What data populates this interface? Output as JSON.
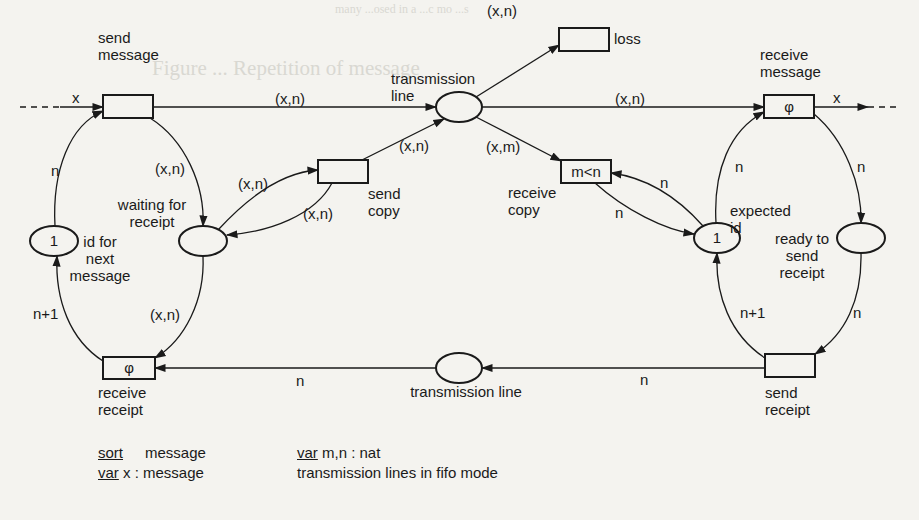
{
  "figure": {
    "ink_color": "#1a1a1a",
    "paper_color": "#f4f3ef",
    "bleed_through": [
      {
        "text": "many ...osed in a ...c mo ...s",
        "x": 335,
        "y": 4,
        "size": 12
      },
      {
        "text": "Figure ... Repetition of message",
        "x": 152,
        "y": 67,
        "size": 21
      }
    ],
    "transitions": [
      {
        "id": "send-message",
        "x": 103,
        "y": 95,
        "w": 50,
        "h": 23,
        "inscription": "",
        "label": [
          "send",
          "message"
        ],
        "label_x": 98,
        "label_y": 43,
        "label_anchor": "start"
      },
      {
        "id": "loss",
        "x": 559,
        "y": 28,
        "w": 50,
        "h": 23,
        "inscription": "",
        "label": [
          "loss"
        ],
        "label_x": 614,
        "label_y": 44,
        "label_anchor": "start"
      },
      {
        "id": "receive-message",
        "x": 764,
        "y": 95,
        "w": 50,
        "h": 23,
        "inscription": "φ",
        "label": [
          "receive",
          "message"
        ],
        "label_x": 760,
        "label_y": 60,
        "label_anchor": "start"
      },
      {
        "id": "send-copy",
        "x": 318,
        "y": 160,
        "w": 50,
        "h": 23,
        "inscription": "",
        "label": [
          "send",
          "copy"
        ],
        "label_x": 368,
        "label_y": 199,
        "label_anchor": "start"
      },
      {
        "id": "receive-copy",
        "x": 561,
        "y": 160,
        "w": 50,
        "h": 23,
        "inscription": "m<n",
        "label": [
          "receive",
          "copy"
        ],
        "label_x": 508,
        "label_y": 198,
        "label_anchor": "start"
      },
      {
        "id": "receive-receipt",
        "x": 103,
        "y": 357,
        "w": 52,
        "h": 22,
        "inscription": "φ",
        "label": [
          "receive",
          "receipt"
        ],
        "label_x": 98,
        "label_y": 398,
        "label_anchor": "start"
      },
      {
        "id": "send-receipt",
        "x": 765,
        "y": 354,
        "w": 50,
        "h": 23,
        "inscription": "",
        "label": [
          "send",
          "receipt"
        ],
        "label_x": 765,
        "label_y": 398,
        "label_anchor": "start"
      }
    ],
    "places": [
      {
        "id": "id-for-next-message",
        "cx": 54,
        "cy": 241,
        "rx": 24,
        "ry": 15,
        "token": "1",
        "label": [
          "id for",
          "next",
          "message"
        ],
        "label_x": 100,
        "label_y": 247,
        "label_anchor": "middle"
      },
      {
        "id": "waiting-for-receipt",
        "cx": 203,
        "cy": 241,
        "rx": 24,
        "ry": 15,
        "token": "",
        "label": [
          "waiting for",
          "receipt"
        ],
        "label_x": 152,
        "label_y": 210,
        "label_anchor": "middle"
      },
      {
        "id": "transmission-line-top",
        "cx": 459,
        "cy": 107,
        "rx": 23,
        "ry": 15,
        "token": "",
        "label": [
          "transmission",
          "line"
        ],
        "label_x": 391,
        "label_y": 84,
        "label_anchor": "start"
      },
      {
        "id": "expected-id",
        "cx": 717,
        "cy": 238,
        "rx": 23,
        "ry": 15,
        "token": "1",
        "label": [
          "expected",
          "id"
        ],
        "label_x": 730,
        "label_y": 216,
        "label_anchor": "start"
      },
      {
        "id": "ready-to-send-receipt",
        "cx": 861,
        "cy": 238,
        "rx": 24,
        "ry": 15,
        "token": "",
        "label": [
          "ready to",
          "send",
          "receipt"
        ],
        "label_x": 802,
        "label_y": 244,
        "label_anchor": "middle"
      },
      {
        "id": "transmission-line-bottom",
        "cx": 459,
        "cy": 368,
        "rx": 23,
        "ry": 15,
        "token": "",
        "label": [
          "transmission line"
        ],
        "label_x": 466,
        "label_y": 397,
        "label_anchor": "middle"
      }
    ],
    "arc_labels": [
      {
        "text": "x",
        "x": 72,
        "y": 103
      },
      {
        "text": "(x,n)",
        "x": 275,
        "y": 104
      },
      {
        "text": "(x,n)",
        "x": 487,
        "y": 16
      },
      {
        "text": "(x,n)",
        "x": 615,
        "y": 104
      },
      {
        "text": "x",
        "x": 833,
        "y": 103
      },
      {
        "text": "n",
        "x": 51,
        "y": 176
      },
      {
        "text": "(x,n)",
        "x": 155,
        "y": 174
      },
      {
        "text": "(x,n)",
        "x": 238,
        "y": 189
      },
      {
        "text": "(x,n)",
        "x": 303,
        "y": 219
      },
      {
        "text": "(x,n)",
        "x": 399,
        "y": 151
      },
      {
        "text": "(x,m)",
        "x": 486,
        "y": 152
      },
      {
        "text": "n",
        "x": 660,
        "y": 188
      },
      {
        "text": "n",
        "x": 615,
        "y": 218
      },
      {
        "text": "n",
        "x": 735,
        "y": 172
      },
      {
        "text": "n",
        "x": 857,
        "y": 172
      },
      {
        "text": "n+1",
        "x": 33,
        "y": 319
      },
      {
        "text": "(x,n)",
        "x": 150,
        "y": 320
      },
      {
        "text": "n",
        "x": 296,
        "y": 386
      },
      {
        "text": "n+1",
        "x": 740,
        "y": 318
      },
      {
        "text": "n",
        "x": 853,
        "y": 318
      },
      {
        "text": "n",
        "x": 640,
        "y": 385
      }
    ],
    "declarations": {
      "left": [
        {
          "keyword": "sort",
          "text": "message"
        },
        {
          "keyword": "var",
          "text": "x : message"
        }
      ],
      "right": [
        {
          "keyword": "var",
          "text": "m,n : nat"
        },
        {
          "keyword": "",
          "text": "transmission lines in fifo mode"
        }
      ]
    }
  }
}
